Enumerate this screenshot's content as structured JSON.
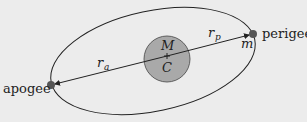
{
  "diagram": {
    "labels": {
      "apogee": "apogee",
      "perigee": "perigee",
      "central_mass": "M",
      "center": "C",
      "orbiting_mass": "m",
      "r_apogee_main": "r",
      "r_apogee_sub": "a",
      "r_perigee_main": "r",
      "r_perigee_sub": "p"
    },
    "colors": {
      "background": "#ececec",
      "planet_fill": "#a9a9a9",
      "dot_fill": "#555555",
      "line": "#222222"
    }
  }
}
